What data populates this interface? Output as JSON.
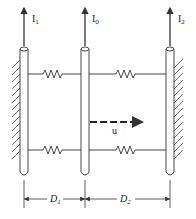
{
  "diagram": {
    "rods": [
      {
        "id": "rod-1",
        "current_label": "I",
        "current_sub": "1",
        "x": 24
      },
      {
        "id": "rod-0",
        "current_label": "I",
        "current_sub": "0",
        "x": 85
      },
      {
        "id": "rod-2",
        "current_label": "I",
        "current_sub": "2",
        "x": 170
      }
    ],
    "velocity": {
      "label": "u"
    },
    "dimensions": [
      {
        "label": "D",
        "sub": "1"
      },
      {
        "label": "D",
        "sub": "2"
      }
    ],
    "colors": {
      "stroke": "#333333",
      "background": "#ffffff"
    }
  }
}
